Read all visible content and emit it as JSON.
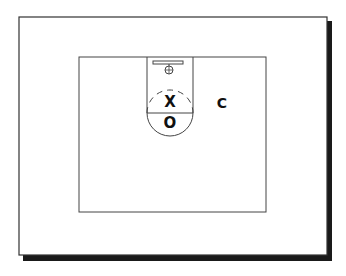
{
  "diagram": {
    "type": "basketball-half-court",
    "players": [
      {
        "id": "x-player",
        "label": "X",
        "x": 170,
        "y": 102
      },
      {
        "id": "o-player",
        "label": "O",
        "x": 170,
        "y": 123
      },
      {
        "id": "c-player",
        "label": "C",
        "x": 222,
        "y": 103
      }
    ],
    "colors": {
      "line": "#333333",
      "shadow": "#1a1a1a",
      "background": "#ffffff",
      "text": "#111111"
    }
  }
}
